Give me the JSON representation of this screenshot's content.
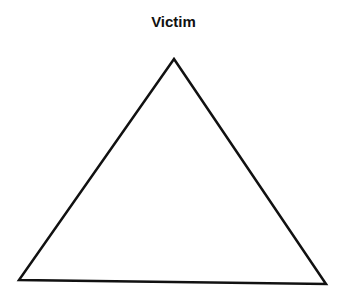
{
  "diagram": {
    "title": "Victim",
    "shape": "triangle",
    "vertices": {
      "top": [
        174,
        59
      ],
      "bottom_left": [
        19,
        280
      ],
      "bottom_right": [
        326,
        284
      ]
    },
    "stroke_color": "#111111",
    "fill_color": "#ffffff"
  }
}
